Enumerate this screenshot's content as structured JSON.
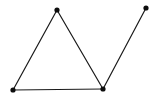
{
  "diagram": {
    "type": "graph",
    "background": "#ffffff",
    "edge_color": "#1a1a1a",
    "node_color": "#0d0d0d",
    "edge_width": 1.2,
    "node_radius": 2.6,
    "nodes": [
      {
        "id": "A",
        "x": 57,
        "y": 10
      },
      {
        "id": "B",
        "x": 13,
        "y": 90
      },
      {
        "id": "C",
        "x": 103,
        "y": 89
      },
      {
        "id": "D",
        "x": 146,
        "y": 8
      }
    ],
    "edges": [
      {
        "from": "A",
        "to": "B"
      },
      {
        "from": "B",
        "to": "C"
      },
      {
        "from": "A",
        "to": "C"
      },
      {
        "from": "C",
        "to": "D"
      }
    ]
  }
}
